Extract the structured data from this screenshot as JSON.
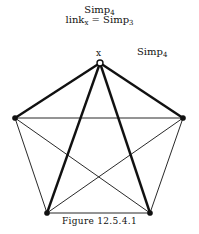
{
  "title": {
    "line1": {
      "base": "Simp",
      "sub": "4"
    },
    "line2": {
      "prefix": "link",
      "prefix_sub": "x",
      "eq": " = Simp",
      "sub": "3"
    }
  },
  "labels": {
    "vertex_x": "x",
    "graph_name": {
      "base": "Simp",
      "sub": "4"
    }
  },
  "caption": "Figure 12.5.4.1",
  "graph": {
    "vertices": [
      {
        "id": "x",
        "x": 100,
        "y": 63,
        "style": "open"
      },
      {
        "id": "left",
        "x": 15,
        "y": 118,
        "style": "filled"
      },
      {
        "id": "right",
        "x": 183,
        "y": 118,
        "style": "filled"
      },
      {
        "id": "bottom-left",
        "x": 47,
        "y": 213,
        "style": "filled"
      },
      {
        "id": "bottom-right",
        "x": 150,
        "y": 213,
        "style": "filled"
      }
    ],
    "edges": [
      {
        "from": "x",
        "to": "left",
        "weight": "thick"
      },
      {
        "from": "x",
        "to": "right",
        "weight": "thick"
      },
      {
        "from": "x",
        "to": "bottom-left",
        "weight": "thick"
      },
      {
        "from": "x",
        "to": "bottom-right",
        "weight": "thick"
      },
      {
        "from": "left",
        "to": "right",
        "weight": "thin"
      },
      {
        "from": "left",
        "to": "bottom-left",
        "weight": "thin"
      },
      {
        "from": "left",
        "to": "bottom-right",
        "weight": "thin"
      },
      {
        "from": "right",
        "to": "bottom-left",
        "weight": "thin"
      },
      {
        "from": "right",
        "to": "bottom-right",
        "weight": "thin"
      },
      {
        "from": "bottom-left",
        "to": "bottom-right",
        "weight": "thin"
      }
    ]
  }
}
